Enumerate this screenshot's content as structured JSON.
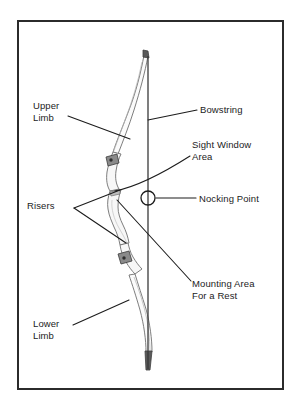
{
  "figure": {
    "border_color": "#2b2b2b",
    "background_color": "#ffffff",
    "ink_color": "#1c1c1c",
    "bow_outline_color": "#6b6b6b"
  },
  "labels": {
    "upper_limb": "Upper\nLimb",
    "lower_limb": "Lower\nLimb",
    "risers": "Risers",
    "bowstring": "Bowstring",
    "sight_window": "Sight Window\nArea",
    "nocking_point": "Nocking Point",
    "mounting_area": "Mounting Area\nFor a Rest"
  },
  "parts": [
    {
      "id": "upper-limb",
      "name": "Upper Limb",
      "side": "left"
    },
    {
      "id": "lower-limb",
      "name": "Lower Limb",
      "side": "left"
    },
    {
      "id": "risers",
      "name": "Risers",
      "side": "left"
    },
    {
      "id": "bowstring",
      "name": "Bowstring",
      "side": "right"
    },
    {
      "id": "sight-window",
      "name": "Sight Window Area",
      "side": "right"
    },
    {
      "id": "nocking-point",
      "name": "Nocking Point",
      "side": "right"
    },
    {
      "id": "mounting-area",
      "name": "Mounting Area For a Rest",
      "side": "right"
    }
  ]
}
